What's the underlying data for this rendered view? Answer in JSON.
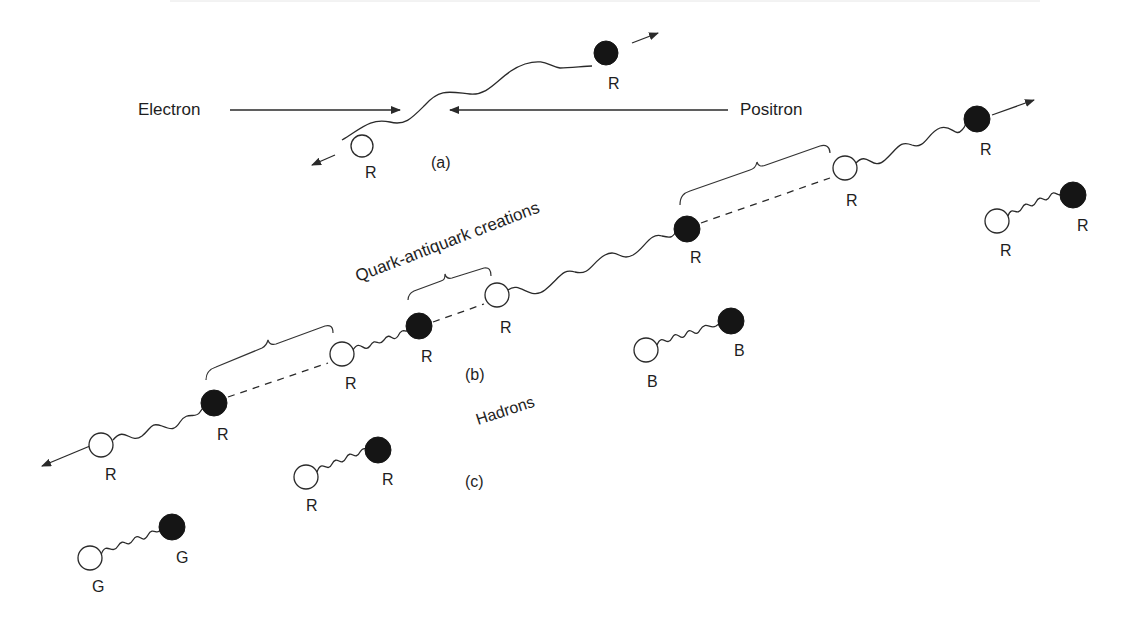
{
  "figure": {
    "labels": {
      "electron": "Electron",
      "positron": "Positron",
      "quark_antiquark_creations": "Quark-antiquark creations",
      "hadrons": "Hadrons",
      "panel_a": "(a)",
      "panel_b": "(b)",
      "panel_c": "(c)"
    },
    "panel_a": {
      "antiquark_color": "R",
      "quark_color": "R"
    },
    "panel_b": {
      "particles": [
        {
          "type": "antiquark",
          "color": "R"
        },
        {
          "type": "quark",
          "color": "R"
        },
        {
          "type": "antiquark",
          "color": "R"
        },
        {
          "type": "quark",
          "color": "R"
        },
        {
          "type": "antiquark",
          "color": "R"
        },
        {
          "type": "quark",
          "color": "R"
        },
        {
          "type": "antiquark",
          "color": "R"
        },
        {
          "type": "quark",
          "color": "R"
        }
      ]
    },
    "panel_c": {
      "hadrons": [
        {
          "antiquark": "G",
          "quark": "G"
        },
        {
          "antiquark": "R",
          "quark": "R"
        },
        {
          "antiquark": "B",
          "quark": "B"
        },
        {
          "antiquark": "R",
          "quark": "R"
        }
      ]
    },
    "colors": {
      "ink": "#1e1e1e",
      "quark_fill": "#151515",
      "antiquark_fill": "#ffffff",
      "background": "#ffffff"
    }
  }
}
